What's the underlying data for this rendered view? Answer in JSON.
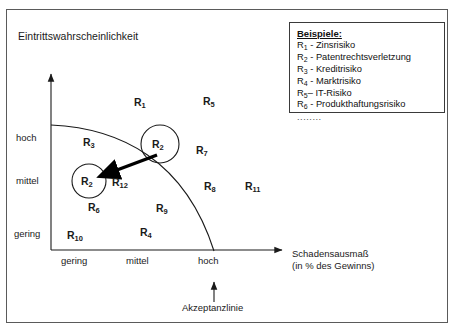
{
  "diagram": {
    "type": "risk-matrix",
    "y_axis": {
      "title": "Eintrittswahrscheinlichkeit",
      "ticks": [
        "hoch",
        "mittel",
        "gering"
      ]
    },
    "x_axis": {
      "title_line1": "Schadensausmaß",
      "title_line2": "(in % des Gewinns)",
      "ticks": [
        "gering",
        "mittel",
        "hoch"
      ]
    },
    "acceptance_line_label": "Akzeptanzlinie",
    "risk_points": [
      {
        "id": "R1",
        "label": "R",
        "sub": "1"
      },
      {
        "id": "R3",
        "label": "R",
        "sub": "3"
      },
      {
        "id": "R5",
        "label": "R",
        "sub": "5"
      },
      {
        "id": "R7",
        "label": "R",
        "sub": "7"
      },
      {
        "id": "R8",
        "label": "R",
        "sub": "8"
      },
      {
        "id": "R11",
        "label": "R",
        "sub": "11"
      },
      {
        "id": "R12",
        "label": "R",
        "sub": "12"
      },
      {
        "id": "R6",
        "label": "R",
        "sub": "6"
      },
      {
        "id": "R9",
        "label": "R",
        "sub": "9"
      },
      {
        "id": "R4",
        "label": "R",
        "sub": "4"
      },
      {
        "id": "R10",
        "label": "R",
        "sub": "10"
      },
      {
        "id": "R2_before",
        "label": "R",
        "sub": "2"
      },
      {
        "id": "R2_after",
        "label": "R",
        "sub": "2"
      }
    ]
  },
  "legend": {
    "title": "Beispiele:",
    "entries": [
      {
        "symbol": "R",
        "sub": "1",
        "dash": "-",
        "text": "Zinsrisiko"
      },
      {
        "symbol": "R",
        "sub": "2",
        "dash": "-",
        "text": "Patentrechtsverletzung"
      },
      {
        "symbol": "R",
        "sub": "3",
        "dash": "-",
        "text": "Kreditrisiko"
      },
      {
        "symbol": "R",
        "sub": "4",
        "dash": "-",
        "text": "Marktrisiko"
      },
      {
        "symbol": "R",
        "sub": "5",
        "dash": "–",
        "text": "IT-Risiko"
      },
      {
        "symbol": "R",
        "sub": "6",
        "dash": "-",
        "text": "Produkthaftungsrisiko"
      }
    ],
    "ellipsis": "........"
  },
  "colors": {
    "line": "#1a1a1a",
    "frame": "#5a5a5a",
    "text": "#1a1a1a",
    "background": "#ffffff"
  }
}
